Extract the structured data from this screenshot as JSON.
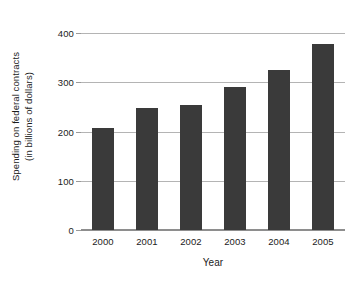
{
  "chart_data": {
    "type": "bar",
    "title": "",
    "subtitle": "",
    "xlabel": "Year",
    "ylabel": "Spending on federal contracts (in billions of dollars)",
    "ylabel_line1": "Spending on federal contracts",
    "ylabel_line2": "(in billions of dollars)",
    "categories": [
      "2000",
      "2001",
      "2002",
      "2003",
      "2004",
      "2005"
    ],
    "values": [
      207,
      247,
      253,
      290,
      325,
      378
    ],
    "ylim": [
      0,
      400
    ],
    "yticks": [
      0,
      100,
      200,
      300,
      400
    ],
    "ytick_labels": [
      "0",
      "100",
      "200",
      "300",
      "400"
    ],
    "grid": true,
    "grid_axis": "y",
    "legend": false,
    "legend_position": "none",
    "bar_color": "#3a3a3a",
    "grid_color": "#b4b4b4",
    "axis_color": "#8e8e8e",
    "background_color": "#ffffff",
    "text_color": "#1b1b1b",
    "series": [
      {
        "name": "Spending on federal contracts",
        "values": [
          207,
          247,
          253,
          290,
          325,
          378
        ]
      }
    ]
  }
}
